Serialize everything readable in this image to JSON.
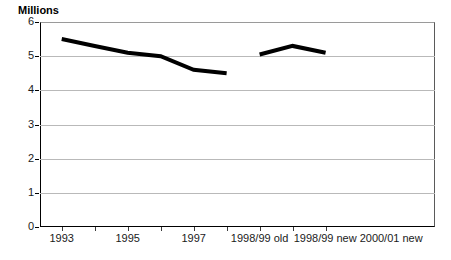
{
  "chart_data": {
    "type": "line",
    "title": "",
    "ylabel": "Millions",
    "xlabel": "",
    "ylim": [
      0,
      6
    ],
    "ytick_values": [
      0,
      1,
      2,
      3,
      4,
      5,
      6
    ],
    "ytick_labels": [
      "0",
      "1",
      "2",
      "3",
      "4",
      "5",
      "6"
    ],
    "grid": true,
    "legend": "none",
    "categories": [
      "1993",
      "1994",
      "1995",
      "1996",
      "1997",
      "1998/99 old",
      "1998/99 new",
      "1999/00 new",
      "2000/01 new"
    ],
    "xtick_labels": [
      "1993",
      "1995",
      "1997",
      "1998/99 old",
      "1998/99 new",
      "2000/01 new"
    ],
    "series": [
      {
        "name": "old series",
        "color": "#000000",
        "x": [
          "1993",
          "1994",
          "1995",
          "1996",
          "1997",
          "1998/99 old"
        ],
        "values": [
          5.5,
          5.3,
          5.1,
          5.0,
          4.6,
          4.5
        ]
      },
      {
        "name": "new series",
        "color": "#000000",
        "x": [
          "1998/99 new",
          "1999/00 new",
          "2000/01 new"
        ],
        "values": [
          5.05,
          5.3,
          5.1
        ]
      }
    ]
  },
  "axis": {
    "y_title": "Millions"
  },
  "y_ticks": [
    {
      "label": "6",
      "value": 6
    },
    {
      "label": "5",
      "value": 5
    },
    {
      "label": "4",
      "value": 4
    },
    {
      "label": "3",
      "value": 3
    },
    {
      "label": "2",
      "value": 2
    },
    {
      "label": "1",
      "value": 1
    },
    {
      "label": "0",
      "value": 0
    }
  ],
  "x_ticks": [
    {
      "label": "1993",
      "pos": 0.055
    },
    {
      "label": "1995",
      "pos": 0.222
    },
    {
      "label": "1997",
      "pos": 0.389
    },
    {
      "label": "1998/99 old",
      "pos": 0.556
    },
    {
      "label": "1998/99 new",
      "pos": 0.722
    },
    {
      "label": "2000/01 new",
      "pos": 0.889
    }
  ]
}
